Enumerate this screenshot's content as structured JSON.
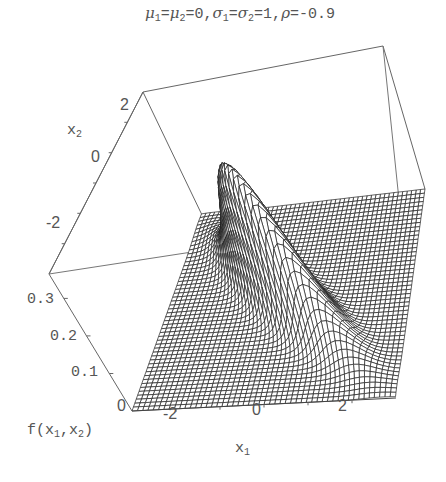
{
  "chart_data": {
    "type": "surface3d",
    "title_parts": {
      "mu": "μ",
      "mu1_sub": "1",
      "mu2_sub": "2",
      "mu_val": "=0,",
      "sigma": "σ",
      "s1_sub": "1",
      "s2_sub": "2",
      "sigma_val": "=1,",
      "rho": "ρ",
      "rho_val": "=-0.9"
    },
    "function": "bivariate normal density f(x1,x2)",
    "params": {
      "mu1": 0,
      "mu2": 0,
      "sigma1": 1,
      "sigma2": 1,
      "rho": -0.9
    },
    "x1_range": [
      -3,
      3
    ],
    "x2_range": [
      -3,
      3
    ],
    "z_range": [
      0,
      0.365
    ],
    "grid_lines": 50,
    "xlabel": "x1",
    "ylabel": "x2",
    "zlabel": "f(x1,x2)",
    "x1_ticks": [
      "-2",
      "0",
      "2"
    ],
    "x2_ticks": [
      "2",
      "0",
      "-2"
    ],
    "z_ticks": [
      "0.3",
      "0.2",
      "0.1",
      "0"
    ],
    "peak_value": 0.365,
    "box": true
  },
  "labels": {
    "x1_prefix": "x",
    "x1_sub": "1",
    "x2_prefix": "x",
    "x2_sub": "2",
    "z_prefix": "f(x",
    "z_sub1": "1",
    "z_mid": ",x",
    "z_sub2": "2",
    "z_suffix": ")"
  }
}
